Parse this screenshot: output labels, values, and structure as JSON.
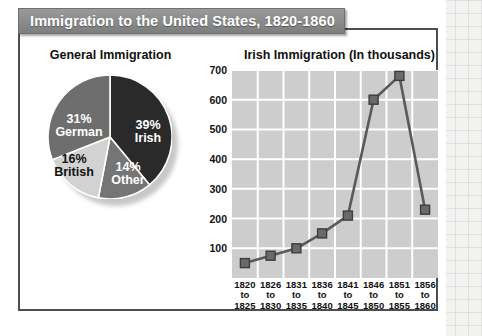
{
  "banner": {
    "title": "Immigration to the United States, 1820-1860"
  },
  "panels": {
    "pie_title": "General Immigration",
    "line_title": "Irish Immigration (In thousands)"
  },
  "colors": {
    "banner_bg": "#8d8d8d",
    "card_border": "#4d4d4d",
    "plot_bg": "#cdcdcd",
    "gridline": "#ffffff",
    "line_series": "#5a5a5a",
    "marker_fill": "#6a6a6a",
    "marker_stroke": "#3c3c3c",
    "slice_irish": "#2a2a2a",
    "slice_german": "#6e6e6e",
    "slice_british": "#d2d2d2",
    "slice_other": "#757575"
  },
  "chart_data": [
    {
      "type": "pie",
      "title": "General Immigration",
      "slices": [
        {
          "label": "Irish",
          "value": 39,
          "pct_text": "39%",
          "color": "#2a2a2a",
          "text_color": "#ffffff"
        },
        {
          "label": "Other",
          "value": 14,
          "pct_text": "14%",
          "color": "#757575",
          "text_color": "#ffffff"
        },
        {
          "label": "British",
          "value": 16,
          "pct_text": "16%",
          "color": "#d2d2d2",
          "text_color": "#111111"
        },
        {
          "label": "German",
          "value": 31,
          "pct_text": "31%",
          "color": "#6e6e6e",
          "text_color": "#ffffff"
        }
      ],
      "units": "percent",
      "legend": "none",
      "labels_inside": true
    },
    {
      "type": "line",
      "title": "Irish Immigration (In thousands)",
      "xlabel": "",
      "ylabel": "",
      "ylim": [
        0,
        700
      ],
      "yticks": [
        100,
        200,
        300,
        400,
        500,
        600,
        700
      ],
      "grid": true,
      "legend": "none",
      "marker": "square",
      "categories": [
        "1820 to 1825",
        "1826 to 1830",
        "1831 to 1835",
        "1836 to 1840",
        "1841 to 1845",
        "1846 to 1850",
        "1851 to 1855",
        "1856 to 1860"
      ],
      "category_lines": [
        [
          "1820",
          "to",
          "1825"
        ],
        [
          "1826",
          "to",
          "1830"
        ],
        [
          "1831",
          "to",
          "1835"
        ],
        [
          "1836",
          "to",
          "1840"
        ],
        [
          "1841",
          "to",
          "1845"
        ],
        [
          "1846",
          "to",
          "1850"
        ],
        [
          "1851",
          "to",
          "1855"
        ],
        [
          "1856",
          "to",
          "1860"
        ]
      ],
      "values": [
        50,
        75,
        100,
        150,
        210,
        600,
        680,
        230
      ],
      "units": "thousands"
    }
  ]
}
